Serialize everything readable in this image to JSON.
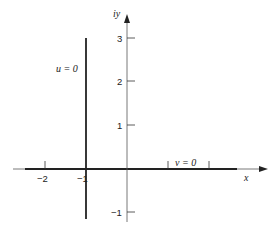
{
  "diagram": {
    "type": "complex-plane",
    "axes": {
      "x_label": "x",
      "y_label": "iy",
      "x_ticks": [
        {
          "value": -2,
          "label": "−2"
        },
        {
          "value": -1,
          "label": "−1"
        }
      ],
      "y_ticks": [
        {
          "value": 3,
          "label": "3"
        },
        {
          "value": 2,
          "label": "2"
        },
        {
          "value": 1,
          "label": "1"
        },
        {
          "value": -1,
          "label": "−1"
        }
      ]
    },
    "curves": [
      {
        "name": "u-zero-line",
        "label": "u = 0",
        "description": "vertical line x = -1"
      },
      {
        "name": "v-zero-line",
        "label": "v = 0",
        "description": "segment along real axis"
      }
    ],
    "colors": {
      "line": "#222222",
      "background": "#ffffff"
    }
  }
}
